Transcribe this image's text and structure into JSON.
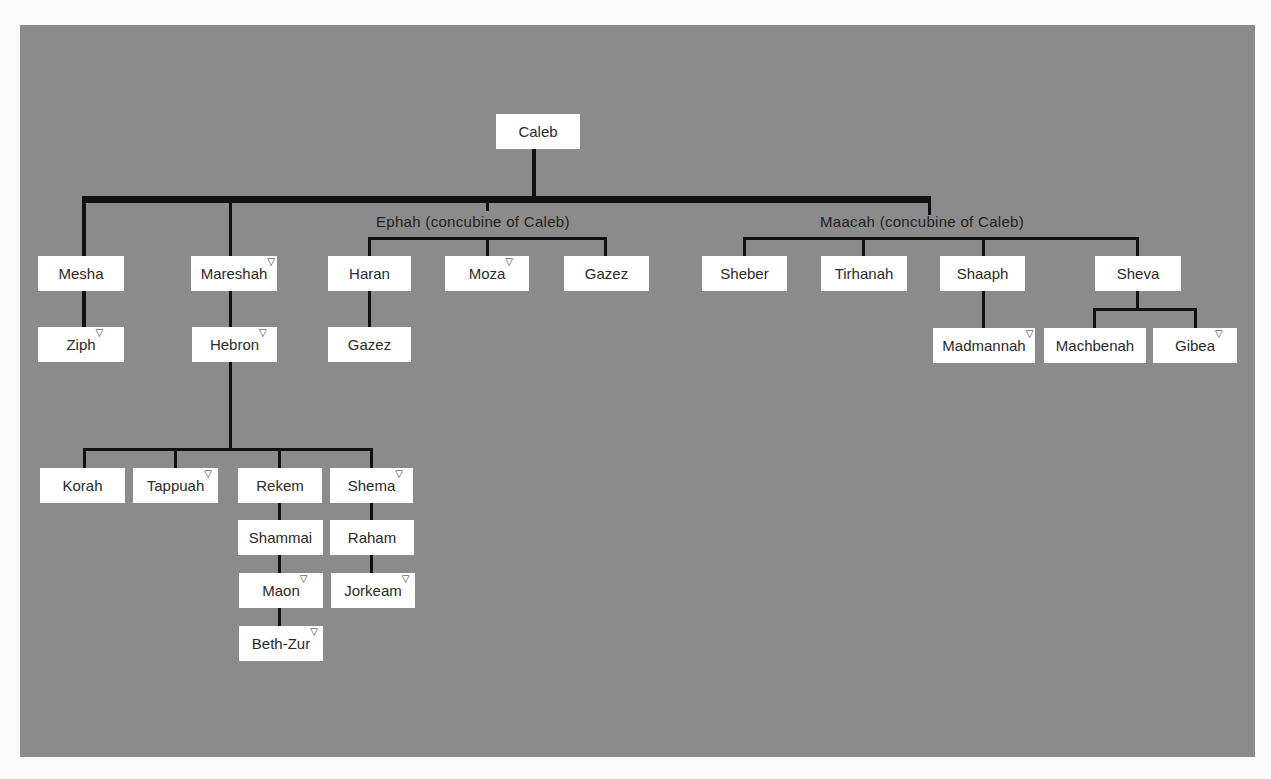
{
  "diagram": {
    "marker_glyph": "▽",
    "marker_meaning": "place name",
    "colors": {
      "panel": "#8b8b8b",
      "page": "#fbfbfb",
      "box": "#ffffff",
      "line": "#111111",
      "text": "#2a2a2a"
    },
    "root": {
      "name": "Caleb"
    },
    "captions": {
      "ephah": "Ephah (concubine of Caleb)",
      "maacah": "Maacah (concubine of Caleb)"
    },
    "nodes": {
      "mesha": {
        "name": "Mesha",
        "marker": false
      },
      "ziph": {
        "name": "Ziph",
        "marker": true
      },
      "mareshah": {
        "name": "Mareshah",
        "marker": true
      },
      "hebron": {
        "name": "Hebron",
        "marker": true
      },
      "korah": {
        "name": "Korah",
        "marker": false
      },
      "tappuah": {
        "name": "Tappuah",
        "marker": true
      },
      "rekem": {
        "name": "Rekem",
        "marker": false
      },
      "shammai": {
        "name": "Shammai",
        "marker": false
      },
      "maon": {
        "name": "Maon",
        "marker": true
      },
      "bethzur": {
        "name": "Beth-Zur",
        "marker": true
      },
      "shema": {
        "name": "Shema",
        "marker": true
      },
      "raham": {
        "name": "Raham",
        "marker": false
      },
      "jorkeam": {
        "name": "Jorkeam",
        "marker": true
      },
      "haran": {
        "name": "Haran",
        "marker": false
      },
      "gazez_haran": {
        "name": "Gazez",
        "marker": false
      },
      "moza": {
        "name": "Moza",
        "marker": true
      },
      "gazez": {
        "name": "Gazez",
        "marker": false
      },
      "sheber": {
        "name": "Sheber",
        "marker": false
      },
      "tirhanah": {
        "name": "Tirhanah",
        "marker": false
      },
      "shaaph": {
        "name": "Shaaph",
        "marker": false
      },
      "madmannah": {
        "name": "Madmannah",
        "marker": true
      },
      "sheva": {
        "name": "Sheva",
        "marker": false
      },
      "machbenah": {
        "name": "Machbenah",
        "marker": false
      },
      "gibea": {
        "name": "Gibea",
        "marker": true
      }
    },
    "edges": [
      [
        "Caleb",
        "Mesha"
      ],
      [
        "Caleb",
        "Mareshah"
      ],
      [
        "Caleb",
        "Ephah (concubine of Caleb)"
      ],
      [
        "Caleb",
        "Maacah (concubine of Caleb)"
      ],
      [
        "Mesha",
        "Ziph"
      ],
      [
        "Mareshah",
        "Hebron"
      ],
      [
        "Hebron",
        "Korah"
      ],
      [
        "Hebron",
        "Tappuah"
      ],
      [
        "Hebron",
        "Rekem"
      ],
      [
        "Hebron",
        "Shema"
      ],
      [
        "Rekem",
        "Shammai"
      ],
      [
        "Shammai",
        "Maon"
      ],
      [
        "Maon",
        "Beth-Zur"
      ],
      [
        "Shema",
        "Raham"
      ],
      [
        "Raham",
        "Jorkeam"
      ],
      [
        "Ephah (concubine of Caleb)",
        "Haran"
      ],
      [
        "Ephah (concubine of Caleb)",
        "Moza"
      ],
      [
        "Ephah (concubine of Caleb)",
        "Gazez"
      ],
      [
        "Haran",
        "Gazez"
      ],
      [
        "Maacah (concubine of Caleb)",
        "Sheber"
      ],
      [
        "Maacah (concubine of Caleb)",
        "Tirhanah"
      ],
      [
        "Maacah (concubine of Caleb)",
        "Shaaph"
      ],
      [
        "Maacah (concubine of Caleb)",
        "Sheva"
      ],
      [
        "Shaaph",
        "Madmannah"
      ],
      [
        "Sheva",
        "Machbenah"
      ],
      [
        "Sheva",
        "Gibea"
      ]
    ]
  }
}
